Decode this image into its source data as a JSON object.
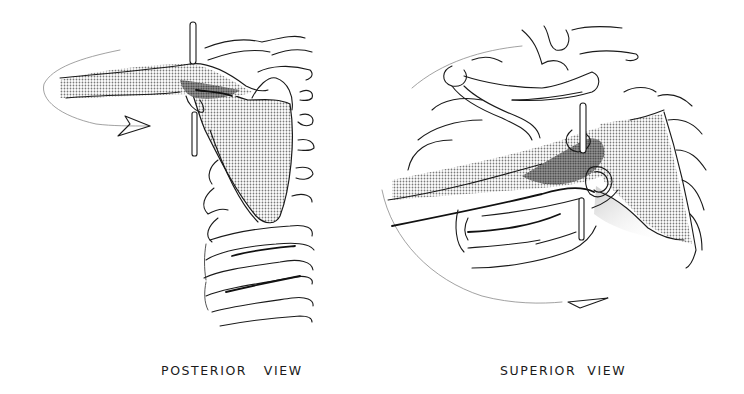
{
  "figures": [
    {
      "id": "posterior",
      "caption": "POSTERIOR   VIEW",
      "subject": "shoulder girdle, scapula over rib cage, with axis rod and rotation arrow"
    },
    {
      "id": "superior",
      "caption": "SUPERIOR  VIEW",
      "subject": "shoulder girdle viewed from above, clavicle and scapula with axis rod and rotation arrow"
    }
  ],
  "colors": {
    "line": "#1a1a1a",
    "shade_light": "#c8c8c8",
    "shade_mid": "#9a9a9a",
    "shade_dark": "#3a3a3a",
    "background": "#ffffff"
  }
}
